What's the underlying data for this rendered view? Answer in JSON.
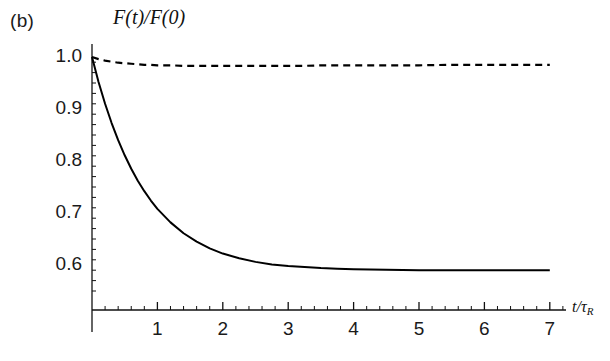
{
  "figure": {
    "panel_label": "(b)",
    "y_axis_label": "F(t)/F(0)",
    "x_axis_label_numer": "t/",
    "x_axis_label_tau": "τ",
    "x_axis_label_sub": "R"
  },
  "chart_data": {
    "type": "line",
    "title": "(b)",
    "xlabel": "t/τ_R",
    "ylabel": "F(t)/F(0)",
    "xlim": [
      0,
      7.3
    ],
    "ylim": [
      0.545,
      1.02
    ],
    "grid": false,
    "legend": "none",
    "x_ticks": [
      1,
      2,
      3,
      4,
      5,
      6,
      7
    ],
    "x_tick_labels": [
      "1",
      "2",
      "3",
      "4",
      "5",
      "6",
      "7"
    ],
    "x_minor_per_major": 5,
    "y_ticks": [
      0.6,
      0.7,
      0.8,
      0.9,
      1.0
    ],
    "y_tick_labels": [
      "0.6",
      "0.7",
      "0.8",
      "0.9",
      "1.0"
    ],
    "y_minor_per_major": 5,
    "x": [
      0,
      0.1,
      0.2,
      0.3,
      0.4,
      0.5,
      0.6,
      0.7,
      0.8,
      0.9,
      1.0,
      1.2,
      1.4,
      1.6,
      1.8,
      2.0,
      2.25,
      2.5,
      2.75,
      3.0,
      3.25,
      3.5,
      3.75,
      4.0,
      4.5,
      5.0,
      5.5,
      6.0,
      6.5,
      7.0
    ],
    "series": [
      {
        "name": "solid-curve",
        "style": "solid",
        "color": "#000000",
        "values": [
          1.0,
          0.952,
          0.91,
          0.873,
          0.84,
          0.811,
          0.785,
          0.762,
          0.742,
          0.724,
          0.708,
          0.682,
          0.661,
          0.645,
          0.632,
          0.622,
          0.613,
          0.606,
          0.601,
          0.598,
          0.596,
          0.594,
          0.593,
          0.592,
          0.591,
          0.59,
          0.59,
          0.59,
          0.59,
          0.59
        ]
      },
      {
        "name": "dashed-curve",
        "style": "dashed",
        "color": "#000000",
        "values": [
          1.0,
          0.996,
          0.993,
          0.991,
          0.989,
          0.988,
          0.987,
          0.986,
          0.985,
          0.985,
          0.984,
          0.984,
          0.983,
          0.983,
          0.983,
          0.983,
          0.983,
          0.983,
          0.983,
          0.983,
          0.983,
          0.984,
          0.984,
          0.984,
          0.984,
          0.984,
          0.985,
          0.985,
          0.985,
          0.985
        ]
      }
    ]
  }
}
